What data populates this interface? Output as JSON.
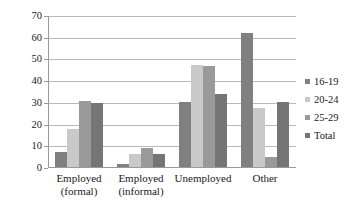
{
  "chart_data": {
    "type": "bar",
    "title": "",
    "subtitle": "",
    "xlabel": "",
    "ylabel": "",
    "ylim": [
      0,
      70
    ],
    "ytick_step": 10,
    "yticks": [
      70,
      60,
      50,
      40,
      30,
      20,
      10,
      0
    ],
    "grid": true,
    "legend_position": "right",
    "categories": [
      "Employed (formal)",
      "Employed (informal)",
      "Unemployed",
      "Other"
    ],
    "category_lines": [
      [
        "Employed",
        "(formal)"
      ],
      [
        "Employed",
        "(informal)"
      ],
      [
        "Unemployed",
        ""
      ],
      [
        "Other",
        ""
      ]
    ],
    "series": [
      {
        "name": "16-19",
        "color": "#808080",
        "values": [
          7,
          1.5,
          30,
          62
        ]
      },
      {
        "name": "20-24",
        "color": "#c9c9c9",
        "values": [
          17.5,
          6,
          47.5,
          27.5
        ]
      },
      {
        "name": "25-29",
        "color": "#9a9a9a",
        "values": [
          30.5,
          9,
          47,
          4.5
        ]
      },
      {
        "name": "Total",
        "color": "#757575",
        "values": [
          29.5,
          6,
          34,
          30
        ]
      }
    ]
  },
  "legend": {
    "items": [
      {
        "label": "16-19",
        "color": "#808080"
      },
      {
        "label": "20-24",
        "color": "#c9c9c9"
      },
      {
        "label": "25-29",
        "color": "#9a9a9a"
      },
      {
        "label": "Total",
        "color": "#757575"
      }
    ]
  },
  "axis": {
    "y_labels": [
      "70",
      "60",
      "50",
      "40",
      "30",
      "20",
      "10",
      "0"
    ]
  }
}
